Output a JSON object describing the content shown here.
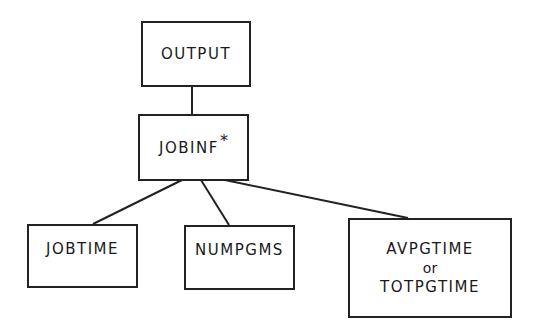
{
  "diagram": {
    "type": "hierarchy",
    "nodes": {
      "output": {
        "label": "OUTPUT"
      },
      "jobinf": {
        "label": "JOBINF",
        "marker": "*"
      },
      "jobtime": {
        "label": "JOBTIME"
      },
      "numpgms": {
        "label": "NUMPGMS"
      },
      "pgtime": {
        "label_a": "AVPGTIME",
        "connector": "or",
        "label_b": "TOTPGTIME"
      }
    },
    "edges": [
      [
        "OUTPUT",
        "JOBINF"
      ],
      [
        "JOBINF",
        "JOBTIME"
      ],
      [
        "JOBINF",
        "NUMPGMS"
      ],
      [
        "JOBINF",
        "AVPGTIME or TOTPGTIME"
      ]
    ]
  }
}
